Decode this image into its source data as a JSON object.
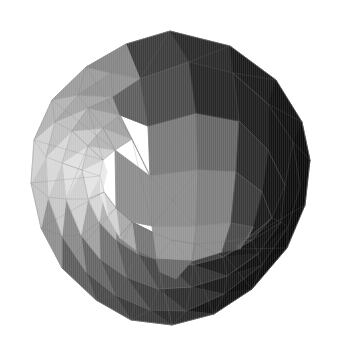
{
  "scene": {
    "title": "shaded polyhedron render",
    "object_name": "subdivided-polyhedron",
    "background_color": "#ffffff",
    "canvas": {
      "width": 339,
      "height": 351
    },
    "wireframe_color": "#6e6e6e",
    "wireframe_opacity": 0.3,
    "shading": "flat-faceted grayscale, light from upper-left",
    "silhouette": [
      [
        170,
        31
      ],
      [
        230,
        46
      ],
      [
        276,
        80
      ],
      [
        302,
        122
      ],
      [
        310,
        160
      ],
      [
        305,
        205
      ],
      [
        287,
        248
      ],
      [
        252,
        289
      ],
      [
        214,
        314
      ],
      [
        172,
        325
      ],
      [
        131,
        320
      ],
      [
        96,
        300
      ],
      [
        62,
        268
      ],
      [
        41,
        228
      ],
      [
        31,
        183
      ],
      [
        34,
        140
      ],
      [
        52,
        100
      ],
      [
        86,
        67
      ],
      [
        126,
        44
      ]
    ],
    "value_range": {
      "lightest": "#e9e9e9",
      "darkest": "#060606"
    }
  },
  "faces": [
    {
      "id": "f01",
      "color": "#3c3c3c",
      "points": "170,31 126,44 140,79 189,62"
    },
    {
      "id": "f02",
      "color": "#2a2a2a",
      "points": "170,31 189,62 233,73 230,46"
    },
    {
      "id": "f03",
      "color": "#1b1b1b",
      "points": "230,46 233,73 268,104 276,80"
    },
    {
      "id": "f04",
      "color": "#121212",
      "points": "276,80 268,104 293,142 302,122"
    },
    {
      "id": "f05",
      "color": "#0c0c0c",
      "points": "302,122 293,142 300,186 310,160"
    },
    {
      "id": "f06",
      "color": "#0a0a0a",
      "points": "310,160 300,186 288,227 305,205"
    },
    {
      "id": "f07",
      "color": "#090909",
      "points": "305,205 288,227 262,265 287,248"
    },
    {
      "id": "f08",
      "color": "#0d0d0d",
      "points": "287,248 262,265 224,294 252,289"
    },
    {
      "id": "f09",
      "color": "#141414",
      "points": "252,289 224,294 186,311 214,314"
    },
    {
      "id": "f10",
      "color": "#2b2b2b",
      "points": "214,314 186,311 150,310 172,325"
    },
    {
      "id": "f11",
      "color": "#3a3a3a",
      "points": "172,325 150,310 115,295 131,320"
    },
    {
      "id": "f12",
      "color": "#4a4a4a",
      "points": "131,320 115,295 86,272 96,300"
    },
    {
      "id": "f13",
      "color": "#5e5e5e",
      "points": "96,300 86,272 62,236 62,268"
    },
    {
      "id": "f14",
      "color": "#8f8f8f",
      "points": "62,268 62,236 48,197 41,228"
    },
    {
      "id": "f15",
      "color": "#c3c3c3",
      "points": "41,228 48,197 46,157 31,183"
    },
    {
      "id": "f16",
      "color": "#d2d2d2",
      "points": "31,183 46,157 55,122 34,140"
    },
    {
      "id": "f17",
      "color": "#b4b4b4",
      "points": "34,140 55,122 78,95 52,100"
    },
    {
      "id": "f18",
      "color": "#9c9c9c",
      "points": "52,100 78,95 111,73 86,67"
    },
    {
      "id": "f19",
      "color": "#868686",
      "points": "86,67 111,73 140,79 126,44"
    },
    {
      "id": "g01",
      "color": "#5c5c5c",
      "points": "140,79 189,62 196,113 148,126"
    },
    {
      "id": "g02",
      "color": "#353535",
      "points": "189,62 233,73 239,121 196,113"
    },
    {
      "id": "g03",
      "color": "#1e1e1e",
      "points": "233,73 268,104 268,150 239,121"
    },
    {
      "id": "g04",
      "color": "#131313",
      "points": "268,104 293,142 285,185 268,150"
    },
    {
      "id": "g05",
      "color": "#0e0e0e",
      "points": "293,142 300,186 281,222 285,185"
    },
    {
      "id": "g06",
      "color": "#0b0b0b",
      "points": "300,186 288,227 258,254 281,222"
    },
    {
      "id": "g07",
      "color": "#101010",
      "points": "288,227 262,265 227,276 258,254"
    },
    {
      "id": "g08",
      "color": "#1a1a1a",
      "points": "262,265 224,294 191,287 227,276"
    },
    {
      "id": "g09",
      "color": "#2e2e2e",
      "points": "224,294 186,311 158,289 191,287"
    },
    {
      "id": "g10",
      "color": "#3f3f3f",
      "points": "186,311 150,310 126,277 158,289"
    },
    {
      "id": "g11",
      "color": "#525252",
      "points": "150,310 115,295 100,259 126,277"
    },
    {
      "id": "g12",
      "color": "#666666",
      "points": "115,295 86,272 81,235 100,259"
    },
    {
      "id": "g13",
      "color": "#8a8a8a",
      "points": "86,272 62,236 66,199 81,235"
    },
    {
      "id": "g14",
      "color": "#c8c8c8",
      "points": "62,236 48,197 62,163 66,199"
    },
    {
      "id": "g15",
      "color": "#d8d8d8",
      "points": "48,197 46,157 72,131 62,163"
    },
    {
      "id": "g16",
      "color": "#c0c0c0",
      "points": "46,157 55,122 88,108 72,131"
    },
    {
      "id": "g17",
      "color": "#a6a6a6",
      "points": "55,122 78,95 113,97 88,108"
    },
    {
      "id": "g18",
      "color": "#929292",
      "points": "78,95 111,73 140,79 113,97"
    },
    {
      "id": "h01",
      "color": "#7a7a7a",
      "points": "148,126 196,113 198,170 150,176"
    },
    {
      "id": "h02",
      "color": "#666666",
      "points": "196,113 239,121 236,172 198,170"
    },
    {
      "id": "h03",
      "color": "#2b2b2b",
      "points": "239,121 268,150 262,192 236,172"
    },
    {
      "id": "h04",
      "color": "#151515",
      "points": "268,150 285,185 272,218 262,192"
    },
    {
      "id": "h05",
      "color": "#0f0f0f",
      "points": "285,185 281,222 252,240 272,218"
    },
    {
      "id": "h06",
      "color": "#141414",
      "points": "281,222 258,254 223,257 252,240"
    },
    {
      "id": "h07",
      "color": "#1d1d1d",
      "points": "258,254 227,276 193,265 223,257"
    },
    {
      "id": "h08",
      "color": "#333333",
      "points": "227,276 191,287 166,262 193,265"
    },
    {
      "id": "h09",
      "color": "#474747",
      "points": "191,287 158,289 138,254 166,262"
    },
    {
      "id": "h10",
      "color": "#5a5a5a",
      "points": "158,289 126,277 116,240 138,254"
    },
    {
      "id": "h11",
      "color": "#727272",
      "points": "126,277 100,259 99,222 116,240"
    },
    {
      "id": "h12",
      "color": "#a0a0a0",
      "points": "100,259 81,235 88,199 99,222"
    },
    {
      "id": "h13",
      "color": "#d0d0d0",
      "points": "81,235 66,199 82,170 88,199"
    },
    {
      "id": "h14",
      "color": "#e0e0e0",
      "points": "66,199 62,163 88,146 82,170"
    },
    {
      "id": "h15",
      "color": "#cacaca",
      "points": "62,163 72,131 103,128 88,146"
    },
    {
      "id": "h16",
      "color": "#ababab",
      "points": "72,131 88,108 120,115 103,128"
    },
    {
      "id": "h17",
      "color": "#969696",
      "points": "88,108 113,97 148,126 120,115"
    },
    {
      "id": "i01",
      "color": "#8b8b8b",
      "points": "150,176 198,170 196,226 152,226"
    },
    {
      "id": "i02",
      "color": "#7e7e7e",
      "points": "198,170 236,172 231,223 196,226"
    },
    {
      "id": "i03",
      "color": "#3a3a3a",
      "points": "236,172 262,192 253,227 231,223"
    },
    {
      "id": "i04",
      "color": "#1b1b1b",
      "points": "262,192 272,218 248,238 253,227"
    },
    {
      "id": "i05",
      "color": "#242424",
      "points": "272,218 252,240 221,242 248,238"
    },
    {
      "id": "i06",
      "color": "#2d2d2d",
      "points": "252,240 223,257 196,244 221,242"
    },
    {
      "id": "i07",
      "color": "#3e3e3e",
      "points": "223,257 193,265 172,240 196,244"
    },
    {
      "id": "i08",
      "color": "#515151",
      "points": "193,265 166,262 152,232 172,240"
    },
    {
      "id": "i09",
      "color": "#666666",
      "points": "166,262 138,254 132,222 152,232"
    },
    {
      "id": "i10",
      "color": "#818181",
      "points": "138,254 116,240 116,208 132,222"
    },
    {
      "id": "i11",
      "color": "#b2b2b2",
      "points": "116,240 99,222 104,192 116,208"
    },
    {
      "id": "i12",
      "color": "#d6d6d6",
      "points": "99,222 88,199 100,176 104,192"
    },
    {
      "id": "i13",
      "color": "#e4e4e4",
      "points": "88,199 82,170 103,160 100,176"
    },
    {
      "id": "i14",
      "color": "#cfcfcf",
      "points": "82,170 88,146 115,150 103,160"
    },
    {
      "id": "i15",
      "color": "#b5b5b5",
      "points": "88,146 103,128 132,139 115,150"
    },
    {
      "id": "i16",
      "color": "#a2a2a2",
      "points": "103,128 120,115 150,176 132,139"
    },
    {
      "id": "j01",
      "color": "#979797",
      "points": "152,226 196,226 192,261 156,259"
    },
    {
      "id": "j02",
      "color": "#8a8a8a",
      "points": "196,226 231,223 222,252 192,261"
    },
    {
      "id": "j03",
      "color": "#4a4a4a",
      "points": "231,223 253,227 240,249 222,252"
    },
    {
      "id": "j04",
      "color": "#585858",
      "points": "253,227 248,238 236,246 240,249"
    },
    {
      "id": "j05",
      "color": "#6b6b6b",
      "points": "156,259 192,261 176,279 160,272"
    },
    {
      "id": "j06",
      "color": "#777777",
      "points": "132,222 152,232 156,259 136,250"
    },
    {
      "id": "j07",
      "color": "#a9a9a9",
      "points": "116,208 132,222 136,250 120,238"
    },
    {
      "id": "j08",
      "color": "#d2d2d2",
      "points": "104,192 116,208 120,238 108,216"
    },
    {
      "id": "j09",
      "color": "#e6e6e6",
      "points": "100,176 104,192 108,216 101,196"
    },
    {
      "id": "j10",
      "color": "#e9e9e9",
      "points": "103,160 100,176 101,196 107,172"
    },
    {
      "id": "k01",
      "color": "#5f5f5f",
      "points": "140,79 148,126 120,115 113,97"
    },
    {
      "id": "k02",
      "color": "#4a4a4a",
      "points": "189,62 196,113 148,126 140,79"
    },
    {
      "id": "k03",
      "color": "#262626",
      "points": "233,73 239,121 196,113 189,62"
    },
    {
      "id": "k04",
      "color": "#8d8d8d",
      "points": "150,176 152,226 132,222 116,208 115,150"
    }
  ],
  "wireframe_paths": [
    "M126,44 L170,31 L230,46 L276,80 L302,122 L310,160 L305,205 L287,248 L252,289 L214,314 L172,325 L131,320 L96,300 L62,268 L41,228 L31,183 L34,140 L52,100 L86,67 Z",
    "M140,79 L189,62 L233,73 L268,104 L293,142 L300,186 L288,227 L262,265 L224,294 L186,311 L150,310 L115,295 L86,272 L62,236 L48,197 L46,157 L55,122 L78,95 L111,73 Z",
    "M148,126 L196,113 L239,121 L268,150 L285,185 L281,222 L258,254 L227,276 L191,287 L158,289 L126,277 L100,259 L81,235 L66,199 L62,163 L72,131 L88,108 L113,97 Z",
    "M150,176 L198,170 L236,172 L262,192 L272,218 L252,240 L223,257 L193,265 L166,262 L138,254 L116,240 L99,222 L88,199 L82,170 L88,146 L103,128 L120,115 Z",
    "M152,226 L196,226 L231,223 L253,227 L248,238 L221,242 L196,244 L172,240 L152,232 L132,222 L116,208 L104,192 L100,176 L103,160 L115,150 L132,139 Z",
    "M170,31 L140,79 L148,126 L150,176 L152,226 L156,259 L172,325",
    "M230,46 L189,62 L196,113 L198,170 L196,226 L192,261 L214,314",
    "M276,80 L233,73 L239,121 L236,172 L231,223 L222,252 L252,289",
    "M302,122 L268,104 L268,150 L262,192 L253,227 L240,249 L287,248",
    "M310,160 L293,142 L285,185 L272,218 L248,238 L305,205",
    "M126,44 L111,73 L113,97 L120,115 L132,139 L86,67",
    "M86,67 L78,95 L88,108 L103,128 L115,150 L52,100",
    "M52,100 L55,122 L72,131 L88,146 L103,160 L34,140",
    "M34,140 L46,157 L62,163 L82,170 L100,176 L31,183",
    "M31,183 L48,197 L66,199 L88,199 L104,192 L41,228",
    "M41,228 L62,236 L81,235 L99,222 L116,208 L62,268",
    "M62,268 L86,272 L100,259 L116,240 L132,222 L96,300",
    "M96,300 L115,295 L126,277 L138,254 L152,232 L131,320",
    "M131,320 L150,310 L158,289 L166,262 L156,259 L172,325",
    "M172,325 L186,311 L191,287 L193,265 L172,240 L156,259",
    "M214,314 L224,294 L227,276 L223,257 L196,244 L192,261",
    "M252,289 L262,265 L258,254 L252,240 L221,242 L222,252",
    "M287,248 L288,227 L281,222 L272,218 L248,238 L240,249",
    "M148,126 L198,170 M150,176 L196,113",
    "M150,176 L196,226 M152,226 L198,170",
    "M88,146 L103,160 M82,170 L88,199 M88,199 L104,192",
    "M62,163 L82,170 M66,199 L88,146 M72,131 L88,146",
    "M103,128 L115,150 M88,108 L103,160",
    "M116,208 L132,222 M99,222 L116,240 M104,192 L116,208",
    "M138,254 L152,232 M126,277 L138,254 M116,240 L132,222",
    "M236,172 L262,192 M239,121 L268,150 M233,73 L268,104",
    "M268,150 L285,185 M262,192 L272,218 M253,227 L248,238",
    "M258,254 L227,276 M252,240 L223,257 M281,222 L252,240",
    "M191,287 L158,289 M193,265 L166,262 M196,244 L172,240"
  ]
}
